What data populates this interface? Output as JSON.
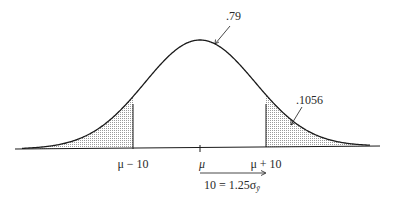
{
  "diagram": {
    "type": "normal-distribution",
    "annotations": {
      "peak_value": ".79",
      "tail_area": ".1056"
    },
    "x_ticks": [
      {
        "label": "μ − 10"
      },
      {
        "label": "μ"
      },
      {
        "label": "μ + 10"
      }
    ],
    "arrow_label": "10 = 1.25σ",
    "arrow_label_subscript": "ȳ",
    "colors": {
      "curve": "#1a1a1a",
      "shading": "#9a9a9a",
      "text": "#2a2a2a"
    }
  }
}
